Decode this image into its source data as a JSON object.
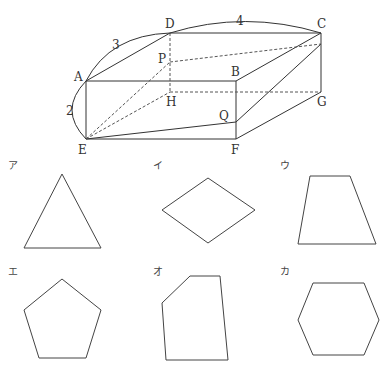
{
  "figure": {
    "vertices": {
      "A": {
        "label": "A",
        "x": 86,
        "y": 81
      },
      "B": {
        "label": "B",
        "x": 236,
        "y": 81
      },
      "C": {
        "label": "C",
        "x": 321,
        "y": 33
      },
      "D": {
        "label": "D",
        "x": 170,
        "y": 33
      },
      "E": {
        "label": "E",
        "x": 86,
        "y": 139
      },
      "F": {
        "label": "F",
        "x": 236,
        "y": 139
      },
      "G": {
        "label": "G",
        "x": 321,
        "y": 92
      },
      "H": {
        "label": "H",
        "x": 170,
        "y": 92
      },
      "P": {
        "label": "P",
        "x": 170,
        "y": 62
      },
      "Q": {
        "label": "Q",
        "x": 236,
        "y": 122
      }
    },
    "dimensions": {
      "AD": "3",
      "DC": "4",
      "AE": "2"
    }
  },
  "options": [
    {
      "label": "ア",
      "shape": "triangle",
      "points": "62,174 24,248 101,248"
    },
    {
      "label": "イ",
      "shape": "rhombus",
      "points": "208,178 162,210 208,243 255,210"
    },
    {
      "label": "ウ",
      "shape": "trapezoid",
      "points": "310,176 350,176 376,244 298,244"
    },
    {
      "label": "エ",
      "shape": "pentagon",
      "points": "62,279 24,310 39,358 86,358 101,310"
    },
    {
      "label": "オ",
      "shape": "irregular-pentagon",
      "points": "190,276 220,276 228,360 166,360 162,303"
    },
    {
      "label": "カ",
      "shape": "hexagon",
      "points": "313,283 364,283 379,320 364,355 313,355 298,320"
    }
  ]
}
